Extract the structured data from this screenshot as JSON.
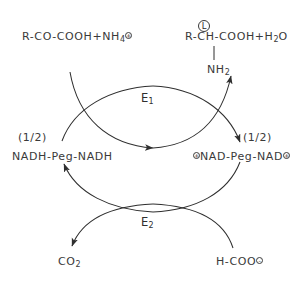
{
  "diagram": {
    "background_color": "#ffffff",
    "stroke_color": "#2f2f2f",
    "top_left": {
      "text": "R-CO-COOH+NH",
      "sub": "4",
      "charge": "+"
    },
    "top_right": {
      "stereo": "L",
      "text": "R-CH-COOH+H",
      "sub": "2",
      "tail": "O",
      "substituent": "NH",
      "substituent_sub": "2"
    },
    "mid_left": {
      "stoichiometry": "(1/2)",
      "text": "NADH-Peg-NADH"
    },
    "mid_right": {
      "stoichiometry": "(1/2)",
      "charge_left": "+",
      "text": "NAD-Peg-NAD",
      "charge_right": "+"
    },
    "bottom_left": {
      "text": "CO",
      "sub": "2"
    },
    "bottom_right": {
      "text": "H-COO",
      "charge": "-"
    },
    "enzymes": [
      {
        "label": "E",
        "sub": "1"
      },
      {
        "label": "E",
        "sub": "2"
      }
    ]
  }
}
